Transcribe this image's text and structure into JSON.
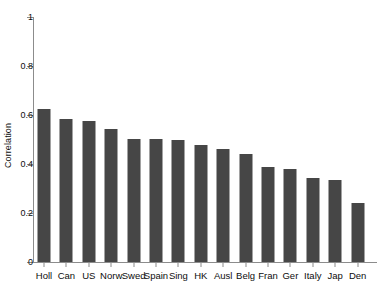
{
  "chart_data": {
    "type": "bar",
    "title": "",
    "xlabel": "",
    "ylabel": "Correlation",
    "ylim": [
      0,
      1
    ],
    "yticks": [
      0,
      0.2,
      0.4,
      0.6,
      0.8,
      1
    ],
    "ytick_labels": [
      "0",
      "0.2",
      "0.4",
      "0.6",
      "0.8",
      "1"
    ],
    "grid": false,
    "legend": null,
    "bar_color": "#464646",
    "axis_color": "#8c8c8c",
    "categories": [
      "Holl",
      "Can",
      "US",
      "Norw",
      "Swed",
      "Spain",
      "Sing",
      "HK",
      "Ausl",
      "Belg",
      "Fran",
      "Ger",
      "Italy",
      "Jap",
      "Den"
    ],
    "values": [
      0.625,
      0.584,
      0.576,
      0.541,
      0.502,
      0.502,
      0.5,
      0.478,
      0.461,
      0.441,
      0.388,
      0.378,
      0.343,
      0.335,
      0.24
    ]
  }
}
